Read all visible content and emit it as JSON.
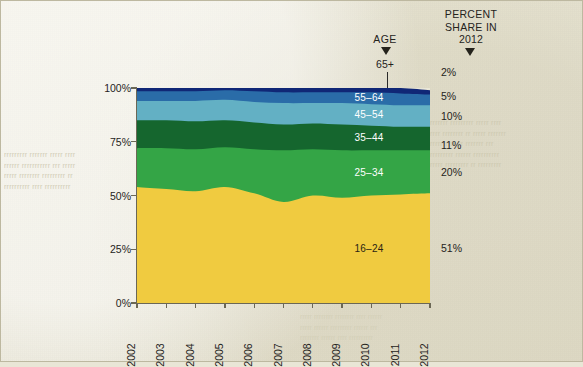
{
  "figure": {
    "background_color": "#e9e6d6",
    "age_header": "AGE",
    "age_top_label": "65+",
    "percent_header_line1": "PERCENT",
    "percent_header_line2": "SHARE IN",
    "percent_header_year": "2012"
  },
  "bleed_text": {
    "left": "rrrrrrrrr rrrrrrr rrrrr rrrr\nrrrrrr rrrrrrrrrrr rrr rrrrr\nrrrrr rrrrrrrr rrrrrrrrr rr\nrrrrrrrrrr rrrr rrrrrrrrrr",
    "right": "rrrrrrr rrrrrrrrr rrrrr rrrr\nrrrr rrrrrrrr rr rrrrr rrrrrrr\nrrrrrrrrrr rr rrrrrrr rrr\nrrrrrrrrr rrrrrr rrrrrrrrrr\nrrrrr rrrrrrrrr rr rrrrrrrrr",
    "bottom": "rrrrr rrrrrrrr rrrrrrrr rrrr rrrrrr\nrrrrr rrrrrr rrrrrrrrr rrrrrr rrr\nrrrrrrrr rrrrrr rrrr rrrrrrrrrr"
  },
  "chart_data": {
    "type": "area",
    "title": "",
    "subtitle": "",
    "xlabel": "",
    "ylabel": "",
    "stacked": true,
    "normalized": true,
    "grid": false,
    "legend_position": "inside-bands",
    "ylim": [
      0,
      100
    ],
    "yticks": [
      0,
      25,
      50,
      75,
      100
    ],
    "ytick_labels": [
      "0%",
      "25%",
      "50%",
      "75%",
      "100%"
    ],
    "x": [
      2002,
      2003,
      2004,
      2005,
      2006,
      2007,
      2008,
      2009,
      2010,
      2011,
      2012
    ],
    "xtick_labels": [
      "2002",
      "2003",
      "2004",
      "2005",
      "2006",
      "2007",
      "2008",
      "2009",
      "2010",
      "2011",
      "2012"
    ],
    "series": [
      {
        "name": "16-24",
        "label": "16–24",
        "color": "#f0cb40",
        "label_color": "#2a2413",
        "share_2012": "51%",
        "values": [
          54,
          53,
          52,
          54,
          51,
          47,
          50,
          49,
          50,
          50.5,
          51
        ]
      },
      {
        "name": "25-34",
        "label": "25–34",
        "color": "#34a546",
        "label_color": "#ffffff",
        "share_2012": "20%",
        "values": [
          18,
          19,
          19.5,
          18.5,
          20.5,
          24,
          21.5,
          22,
          21,
          20.5,
          20
        ]
      },
      {
        "name": "35-44",
        "label": "35–44",
        "color": "#15662e",
        "label_color": "#ffffff",
        "share_2012": "11%",
        "values": [
          13,
          13,
          13,
          12.5,
          12.5,
          12,
          12,
          12,
          11.5,
          11,
          11
        ]
      },
      {
        "name": "45-54",
        "label": "45–54",
        "color": "#63b0c4",
        "label_color": "#ffffff",
        "share_2012": "10%",
        "values": [
          9,
          9,
          9.5,
          9.5,
          9.5,
          10,
          9.5,
          10,
          10,
          10,
          10
        ]
      },
      {
        "name": "55-64",
        "label": "55–64",
        "color": "#2a6ca8",
        "label_color": "#ffffff",
        "share_2012": "5%",
        "values": [
          4.5,
          4.5,
          4.5,
          4.5,
          5,
          5,
          5,
          5,
          5.5,
          5.5,
          5
        ]
      },
      {
        "name": "65+",
        "label": "65+",
        "color": "#102776",
        "label_color": "#25231c",
        "share_2012": "2%",
        "values": [
          1.5,
          1.5,
          1.5,
          1.5,
          1.5,
          2,
          2,
          2,
          2,
          2.5,
          2
        ]
      }
    ],
    "percent_shares_2012": [
      "2%",
      "5%",
      "10%",
      "11%",
      "20%",
      "51%"
    ]
  }
}
